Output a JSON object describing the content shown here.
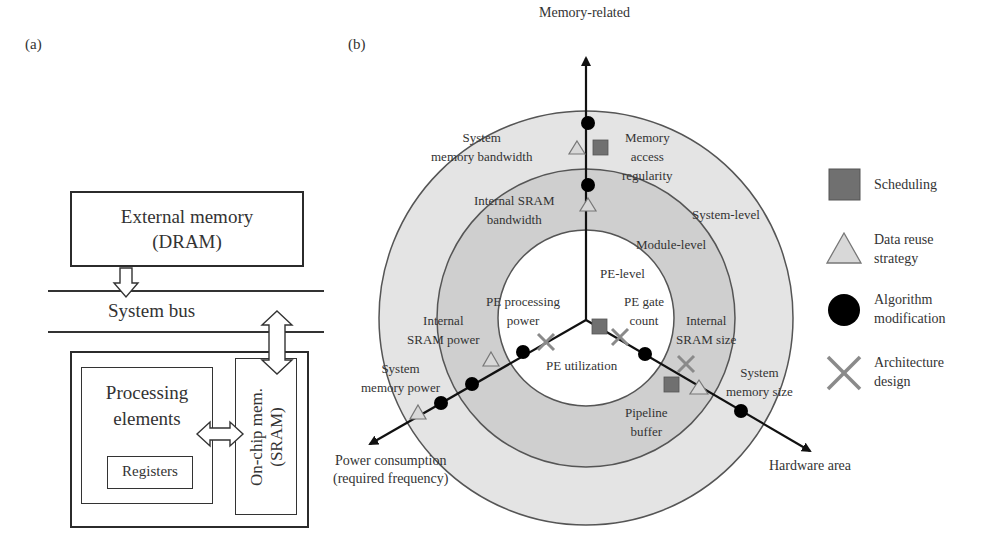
{
  "panel_a": {
    "label": "(a)",
    "external_memory": {
      "line1": "External memory",
      "line2": "(DRAM)"
    },
    "system_bus": "System bus",
    "processing_elements": {
      "line1": "Processing",
      "line2": "elements"
    },
    "registers": "Registers",
    "on_chip_memory": {
      "line1": "On-chip mem.",
      "line2": "(SRAM)"
    }
  },
  "panel_b": {
    "label": "(b)",
    "axes": {
      "memory": "Memory-related",
      "power": {
        "line1": "Power consumption",
        "line2": "(required frequency)"
      },
      "hardware": "Hardware area"
    },
    "levels": {
      "system": "System-level",
      "module": "Module-level",
      "pe": "PE-level"
    },
    "items": {
      "system_memory_bandwidth": {
        "line1": "System",
        "line2": "memory bandwidth"
      },
      "memory_access_regularity": {
        "line1": "Memory",
        "line2": "access",
        "line3": "regularity"
      },
      "internal_sram_bandwidth": {
        "line1": "Internal SRAM",
        "line2": "bandwidth"
      },
      "pe_processing_power": {
        "line1": "PE processing",
        "line2": "power"
      },
      "pe_gate_count": {
        "line1": "PE gate",
        "line2": "count"
      },
      "pe_utilization": "PE utilization",
      "internal_sram_power": {
        "line1": "Internal",
        "line2": "SRAM power"
      },
      "system_memory_power": {
        "line1": "System",
        "line2": "memory power"
      },
      "internal_sram_size": {
        "line1": "Internal",
        "line2": "SRAM size"
      },
      "system_memory_size": {
        "line1": "System",
        "line2": "memory size"
      },
      "pipeline_buffer": {
        "line1": "Pipeline",
        "line2": "buffer"
      }
    },
    "legend": [
      {
        "marker": "square",
        "line1": "Scheduling",
        "line2": ""
      },
      {
        "marker": "triangle",
        "line1": "Data reuse",
        "line2": "strategy"
      },
      {
        "marker": "circle",
        "line1": "Algorithm",
        "line2": "modification"
      },
      {
        "marker": "cross",
        "line1": "Architecture",
        "line2": "design"
      }
    ],
    "colors": {
      "outer_ring": "#e4e4e4",
      "middle_ring": "#cfcfcf",
      "inner_disc": "#ffffff",
      "square": "#707070",
      "triangle": "#d8d8d8",
      "circle": "#000000",
      "cross": "#8a8a8a"
    }
  }
}
